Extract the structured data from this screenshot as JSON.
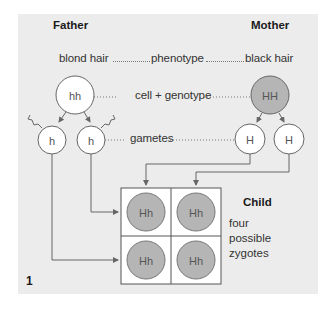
{
  "headers": {
    "father": "Father",
    "mother": "Mother",
    "child": "Child"
  },
  "rows": {
    "phenotype": {
      "father": "blond hair",
      "label": "phenotype",
      "mother": "black hair"
    },
    "genotype": {
      "label": "cell + genotype",
      "father": "hh",
      "mother": "HH"
    },
    "gametes": {
      "label": "gametes",
      "father": [
        "h",
        "h"
      ],
      "mother": [
        "H",
        "H"
      ]
    }
  },
  "punnett": {
    "cells": [
      "Hh",
      "Hh",
      "Hh",
      "Hh"
    ]
  },
  "zygote_note": [
    "four",
    "possible",
    "zygotes"
  ],
  "figure_number": "1",
  "colors": {
    "panel": "#ececec",
    "dominant_fill": "#b5b5b5",
    "recessive_fill": "#ffffff",
    "line": "#666666"
  }
}
